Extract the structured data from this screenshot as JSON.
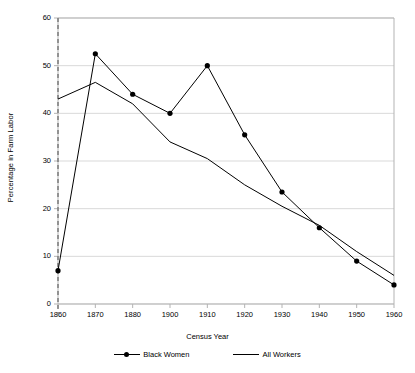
{
  "chart_data": {
    "type": "line",
    "title": "",
    "xlabel": "Census Year",
    "ylabel": "Percentage in Farm Labor",
    "categories": [
      "1860",
      "1870",
      "1880",
      "1900",
      "1910",
      "1920",
      "1930",
      "1940",
      "1950",
      "1960"
    ],
    "x": [
      1860,
      1870,
      1880,
      1900,
      1910,
      1920,
      1930,
      1940,
      1950,
      1960
    ],
    "xtick_labels": [
      "1860",
      "1870",
      "1880",
      "1900",
      "1910",
      "1920",
      "1930",
      "1940",
      "1950",
      "1960"
    ],
    "ytick_labels": [
      "0",
      "10",
      "20",
      "30",
      "40",
      "50",
      "60"
    ],
    "ytick_values": [
      0,
      10,
      20,
      30,
      40,
      50,
      60
    ],
    "ylim": [
      0,
      60
    ],
    "grid": "horizontal",
    "legend_position": "bottom",
    "series": [
      {
        "name": "Black Women",
        "marker": "circle",
        "values": [
          7,
          52.5,
          44,
          40,
          50,
          35.5,
          23.5,
          16,
          9,
          4
        ]
      },
      {
        "name": "All Workers",
        "marker": "none",
        "values": [
          43,
          46.5,
          42,
          34,
          30.5,
          25,
          20.5,
          16.5,
          11,
          6
        ]
      }
    ],
    "annotations": [
      {
        "type": "vertical-reference-line",
        "x": 1860,
        "style": "dashed",
        "color": "#808080"
      }
    ],
    "colors": {
      "series_line": "#000000",
      "gridline": "#d9d9d9",
      "axis": "#b3b3b3",
      "reference_line": "#808080"
    }
  },
  "legend": {
    "entries": [
      {
        "label": "Black Women"
      },
      {
        "label": "All Workers"
      }
    ]
  }
}
